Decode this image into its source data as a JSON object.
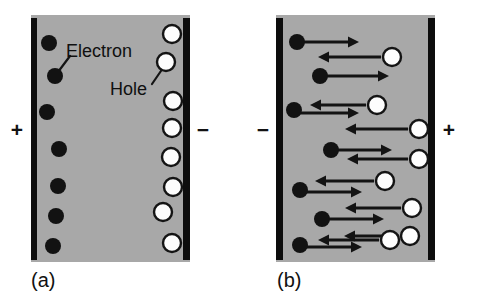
{
  "figure": {
    "type": "semiconductor-carrier-drift-diagram",
    "background_color": "#ffffff",
    "slab_fill_color": "#a8a8a8",
    "electrode_color": "#0d0d0d",
    "electron_color": "#121212",
    "hole_fill_color": "#fdfdfd",
    "hole_stroke_color": "#141414",
    "arrow_color": "#131313"
  },
  "panels": [
    {
      "id": "a",
      "caption": "(a)",
      "caption_x": 31,
      "caption_y": 270,
      "slab": {
        "x": 31,
        "y": 15,
        "width": 159,
        "height": 247
      },
      "left_electrode": {
        "x": 31,
        "y": 18,
        "width": 6,
        "height": 242
      },
      "right_electrode": {
        "x": 183,
        "y": 18,
        "width": 7,
        "height": 242
      },
      "left_polarity": {
        "label": "+",
        "x": 6,
        "y": 119
      },
      "right_polarity": {
        "label": "−",
        "x": 192,
        "y": 119
      },
      "electrons": [
        {
          "cx": 49,
          "cy": 43,
          "r": 8
        },
        {
          "cx": 55,
          "cy": 76,
          "r": 8
        },
        {
          "cx": 47,
          "cy": 112,
          "r": 8
        },
        {
          "cx": 59,
          "cy": 149,
          "r": 8
        },
        {
          "cx": 58,
          "cy": 186,
          "r": 8
        },
        {
          "cx": 56,
          "cy": 216,
          "r": 8
        },
        {
          "cx": 53,
          "cy": 246,
          "r": 8
        }
      ],
      "holes": [
        {
          "cx": 172,
          "cy": 34,
          "r": 9
        },
        {
          "cx": 166,
          "cy": 62,
          "r": 9
        },
        {
          "cx": 173,
          "cy": 101,
          "r": 9
        },
        {
          "cx": 172,
          "cy": 128,
          "r": 9
        },
        {
          "cx": 171,
          "cy": 157,
          "r": 9
        },
        {
          "cx": 173,
          "cy": 187,
          "r": 9
        },
        {
          "cx": 163,
          "cy": 212,
          "r": 9
        },
        {
          "cx": 172,
          "cy": 243,
          "r": 9
        }
      ],
      "annotations": [
        {
          "label": "Electron",
          "text_x": 66,
          "text_y": 42,
          "leader": {
            "x1": 70,
            "y1": 56,
            "x2": 58,
            "y2": 72
          }
        },
        {
          "label": "Hole",
          "text_x": 110,
          "text_y": 80,
          "leader": {
            "x1": 152,
            "y1": 84,
            "x2": 163,
            "y2": 68
          }
        }
      ]
    },
    {
      "id": "b",
      "caption": "(b)",
      "caption_x": 277,
      "caption_y": 270,
      "slab": {
        "x": 276,
        "y": 15,
        "width": 159,
        "height": 247
      },
      "left_electrode": {
        "x": 276,
        "y": 18,
        "width": 7,
        "height": 242
      },
      "right_electrode": {
        "x": 428,
        "y": 18,
        "width": 7,
        "height": 242
      },
      "left_polarity": {
        "label": "−",
        "x": 252,
        "y": 119
      },
      "right_polarity": {
        "label": "+",
        "x": 438,
        "y": 119
      },
      "electrons": [
        {
          "cx": 297,
          "cy": 42,
          "r": 8,
          "arrow": {
            "x1": 297,
            "y1": 42,
            "x2": 359,
            "y2": 42,
            "dir": "right"
          }
        },
        {
          "cx": 320,
          "cy": 76,
          "r": 8,
          "arrow": {
            "x1": 320,
            "y1": 76,
            "x2": 389,
            "y2": 76,
            "dir": "right"
          }
        },
        {
          "cx": 294,
          "cy": 110,
          "r": 8,
          "arrow": {
            "x1": 294,
            "y1": 113,
            "x2": 359,
            "y2": 113,
            "dir": "right"
          }
        },
        {
          "cx": 331,
          "cy": 150,
          "r": 8,
          "arrow": {
            "x1": 331,
            "y1": 150,
            "x2": 392,
            "y2": 150,
            "dir": "right"
          }
        },
        {
          "cx": 300,
          "cy": 190,
          "r": 8,
          "arrow": {
            "x1": 300,
            "y1": 192,
            "x2": 362,
            "y2": 192,
            "dir": "right"
          }
        },
        {
          "cx": 322,
          "cy": 219,
          "r": 8,
          "arrow": {
            "x1": 322,
            "y1": 219,
            "x2": 384,
            "y2": 219,
            "dir": "right"
          }
        },
        {
          "cx": 300,
          "cy": 245,
          "r": 8,
          "arrow": {
            "x1": 300,
            "y1": 247,
            "x2": 362,
            "y2": 247,
            "dir": "right"
          }
        }
      ],
      "holes": [
        {
          "cx": 392,
          "cy": 57,
          "r": 9,
          "arrow": {
            "x1": 381,
            "y1": 57,
            "x2": 318,
            "y2": 57,
            "dir": "left"
          }
        },
        {
          "cx": 377,
          "cy": 105,
          "r": 9,
          "arrow": {
            "x1": 366,
            "y1": 105,
            "x2": 310,
            "y2": 105,
            "dir": "left"
          }
        },
        {
          "cx": 419,
          "cy": 129,
          "r": 9,
          "arrow": {
            "x1": 408,
            "y1": 129,
            "x2": 345,
            "y2": 129,
            "dir": "left"
          }
        },
        {
          "cx": 419,
          "cy": 159,
          "r": 9,
          "arrow": {
            "x1": 408,
            "y1": 159,
            "x2": 347,
            "y2": 159,
            "dir": "left"
          }
        },
        {
          "cx": 385,
          "cy": 181,
          "r": 9,
          "arrow": {
            "x1": 374,
            "y1": 181,
            "x2": 315,
            "y2": 181,
            "dir": "left"
          }
        },
        {
          "cx": 412,
          "cy": 208,
          "r": 9,
          "arrow": {
            "x1": 401,
            "y1": 208,
            "x2": 345,
            "y2": 208,
            "dir": "left"
          }
        },
        {
          "cx": 410,
          "cy": 236,
          "r": 9,
          "arrow": {
            "x1": 399,
            "y1": 236,
            "x2": 344,
            "y2": 236,
            "dir": "left"
          }
        },
        {
          "cx": 390,
          "cy": 240,
          "r": 9,
          "arrow": {
            "x1": 379,
            "y1": 240,
            "x2": 318,
            "y2": 240,
            "dir": "left"
          }
        }
      ]
    }
  ]
}
